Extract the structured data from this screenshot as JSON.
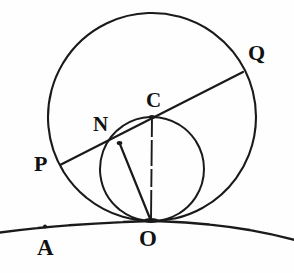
{
  "figure": {
    "kind": "geometry-diagram",
    "background_color": "#fefefe",
    "ink_color": "#1a1a1a",
    "width": 294,
    "height": 273,
    "labels": [
      {
        "id": "Q",
        "text": "Q",
        "x": 248,
        "y": 42
      },
      {
        "id": "C",
        "text": "C",
        "x": 146,
        "y": 90
      },
      {
        "id": "N",
        "text": "N",
        "x": 93,
        "y": 114
      },
      {
        "id": "P",
        "text": "P",
        "x": 34,
        "y": 153
      },
      {
        "id": "O",
        "text": "O",
        "x": 139,
        "y": 227
      },
      {
        "id": "A",
        "text": "A",
        "x": 37,
        "y": 236
      }
    ],
    "points": [
      {
        "id": "C",
        "x": 152,
        "y": 117,
        "role": "center-of-large-circle"
      },
      {
        "id": "O",
        "x": 151,
        "y": 221,
        "role": "tangency-point"
      },
      {
        "id": "N",
        "x": 120,
        "y": 143,
        "role": "point-on-small-circle"
      },
      {
        "id": "P",
        "x": 61,
        "y": 164,
        "role": "chord-endpoint-left"
      },
      {
        "id": "Q",
        "x": 243,
        "y": 72,
        "role": "chord-endpoint-right"
      },
      {
        "id": "A",
        "x": 45,
        "y": 227,
        "role": "point-on-base-arc"
      }
    ],
    "circles": [
      {
        "id": "large-circle",
        "cx": 152,
        "cy": 117,
        "r": 104
      },
      {
        "id": "small-circle",
        "cx": 152,
        "cy": 169,
        "r": 52
      }
    ],
    "lines": [
      {
        "id": "chord-PQ",
        "from": "P",
        "to": "Q"
      },
      {
        "id": "segment-NO",
        "from": "N",
        "to": "O"
      },
      {
        "id": "segment-CO",
        "from": "C",
        "to": "O",
        "style": "dashed"
      }
    ],
    "arcs": [
      {
        "id": "base-arc",
        "description": "tangent ground arc through O and A"
      }
    ]
  }
}
